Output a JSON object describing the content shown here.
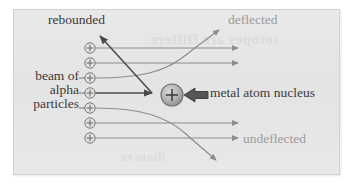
{
  "figure": {
    "name": "alpha-particle-scattering-diagram",
    "panel_background": "#e6e6e6",
    "page_background": "#ffffff",
    "border_color": "#d2d2d2"
  },
  "labels": {
    "rebounded": "rebounded",
    "deflected": "deflected",
    "undeflected": "undeflected",
    "nucleus": "metal atom nucleus",
    "beam_line1": "beam of",
    "beam_line2": "alpha",
    "beam_line3": "particles"
  },
  "colors": {
    "dark_text": "#3a3a3a",
    "light_text": "#9a9a9a",
    "ray": "#8c8c8c",
    "dark_arrow": "#4a4a4a",
    "nucleus_fill": "#b4b4b4",
    "nucleus_stroke": "#6e6e6e",
    "particle_stroke": "#7a7a7a"
  },
  "particles": {
    "symbol": "+",
    "count": 7,
    "x": 90,
    "radius": 5.2,
    "y_positions": [
      48,
      63,
      78,
      93,
      108,
      123,
      138
    ]
  },
  "nucleus": {
    "symbol": "+",
    "cx": 172,
    "cy": 95,
    "r": 11
  },
  "bleed_through": {
    "line1": "sotopes are Differe",
    "line2": "llium ex"
  }
}
